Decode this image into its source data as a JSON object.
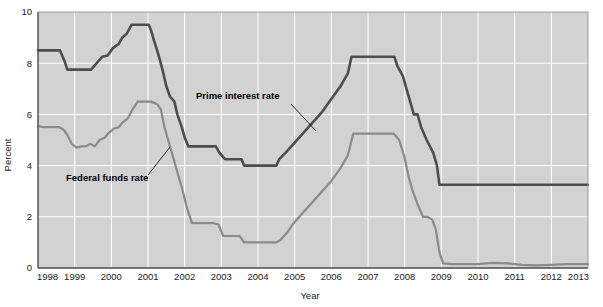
{
  "chart_data": {
    "type": "line",
    "title": "",
    "xlabel": "Year",
    "ylabel": "Percent",
    "xlim": [
      1998,
      2013
    ],
    "ylim": [
      0,
      10
    ],
    "ytick_values": [
      0,
      2,
      4,
      6,
      8,
      10
    ],
    "ytick_labels": [
      "0",
      "2",
      "4",
      "6",
      "8",
      "10"
    ],
    "xtick_values": [
      1998,
      1999,
      2000,
      2001,
      2002,
      2003,
      2004,
      2005,
      2006,
      2007,
      2008,
      2009,
      2010,
      2011,
      2012,
      2013
    ],
    "xtick_labels": [
      "1998",
      "1999",
      "2000",
      "2001",
      "2002",
      "2003",
      "2004",
      "2005",
      "2006",
      "2007",
      "2008",
      "2009",
      "2010",
      "2011",
      "2012",
      "2013"
    ],
    "grid": true,
    "grid_color": "#ffffff",
    "plot_background": "#d2d2d2",
    "legend_position": "inline-annotations",
    "series": [
      {
        "name": "Prime interest rate",
        "color": "#4d4d4d",
        "line_width": 2.6,
        "annotation_label": "Prime interest rate",
        "x": [
          1998.0,
          1998.6,
          1998.72,
          1998.8,
          1999.05,
          1999.45,
          1999.6,
          1999.75,
          1999.9,
          2000.05,
          2000.2,
          2000.3,
          2000.42,
          2000.55,
          2000.7,
          2001.02,
          2001.08,
          2001.17,
          2001.25,
          2001.33,
          2001.42,
          2001.5,
          2001.6,
          2001.72,
          2001.8,
          2001.92,
          2002.0,
          2002.1,
          2002.85,
          2002.95,
          2003.1,
          2003.55,
          2003.62,
          2004.0,
          2004.5,
          2004.58,
          2004.75,
          2005.0,
          2005.25,
          2005.5,
          2005.75,
          2006.0,
          2006.25,
          2006.45,
          2006.55,
          2007.0,
          2007.4,
          2007.72,
          2007.8,
          2007.95,
          2008.05,
          2008.15,
          2008.25,
          2008.35,
          2008.45,
          2008.6,
          2008.78,
          2008.88,
          2008.95,
          2009.0,
          2010.0,
          2011.0,
          2012.0,
          2013.0
        ],
        "y": [
          8.5,
          8.5,
          8.1,
          7.75,
          7.75,
          7.75,
          8.0,
          8.25,
          8.3,
          8.6,
          8.75,
          9.0,
          9.15,
          9.5,
          9.5,
          9.5,
          9.3,
          8.85,
          8.5,
          8.1,
          7.6,
          7.1,
          6.7,
          6.5,
          6.0,
          5.5,
          5.1,
          4.75,
          4.75,
          4.5,
          4.25,
          4.25,
          4.0,
          4.0,
          4.0,
          4.25,
          4.5,
          4.9,
          5.3,
          5.7,
          6.1,
          6.6,
          7.1,
          7.6,
          8.25,
          8.25,
          8.25,
          8.25,
          7.9,
          7.5,
          7.0,
          6.5,
          6.0,
          6.0,
          5.5,
          5.0,
          4.5,
          4.0,
          3.25,
          3.25,
          3.25,
          3.25,
          3.25,
          3.25
        ]
      },
      {
        "name": "Federal funds rate",
        "color": "#8a8a8a",
        "line_width": 2.2,
        "annotation_label": "Federal funds rate",
        "x": [
          1998.0,
          1998.15,
          1998.3,
          1998.45,
          1998.58,
          1998.7,
          1998.8,
          1998.92,
          1999.05,
          1999.18,
          1999.3,
          1999.42,
          1999.55,
          1999.68,
          1999.82,
          1999.95,
          2000.08,
          2000.2,
          2000.32,
          2000.45,
          2000.58,
          2000.72,
          2000.85,
          2001.0,
          2001.08,
          2001.17,
          2001.25,
          2001.35,
          2001.45,
          2001.55,
          2001.65,
          2001.75,
          2001.85,
          2001.95,
          2002.05,
          2002.2,
          2002.5,
          2002.8,
          2002.92,
          2003.05,
          2003.25,
          2003.5,
          2003.62,
          2003.8,
          2004.2,
          2004.5,
          2004.62,
          2004.8,
          2005.0,
          2005.25,
          2005.5,
          2005.75,
          2006.0,
          2006.25,
          2006.45,
          2006.6,
          2007.0,
          2007.4,
          2007.7,
          2007.85,
          2008.0,
          2008.12,
          2008.22,
          2008.35,
          2008.5,
          2008.62,
          2008.75,
          2008.85,
          2008.95,
          2009.05,
          2009.3,
          2009.6,
          2010.0,
          2010.4,
          2010.8,
          2011.2,
          2011.6,
          2012.0,
          2012.4,
          2012.8,
          2013.0
        ],
        "y": [
          5.55,
          5.5,
          5.5,
          5.5,
          5.5,
          5.4,
          5.2,
          4.85,
          4.7,
          4.75,
          4.75,
          4.85,
          4.75,
          5.0,
          5.1,
          5.3,
          5.45,
          5.5,
          5.7,
          5.85,
          6.2,
          6.5,
          6.5,
          6.5,
          6.5,
          6.45,
          6.4,
          6.2,
          5.5,
          5.0,
          4.5,
          4.0,
          3.5,
          3.0,
          2.4,
          1.75,
          1.75,
          1.75,
          1.7,
          1.25,
          1.25,
          1.25,
          1.0,
          1.0,
          1.0,
          1.0,
          1.1,
          1.4,
          1.8,
          2.2,
          2.6,
          3.0,
          3.4,
          3.9,
          4.4,
          5.25,
          5.25,
          5.25,
          5.25,
          5.0,
          4.3,
          3.5,
          3.0,
          2.5,
          2.0,
          2.0,
          1.9,
          1.5,
          0.6,
          0.18,
          0.15,
          0.15,
          0.15,
          0.2,
          0.18,
          0.12,
          0.1,
          0.12,
          0.15,
          0.15,
          0.15
        ]
      }
    ]
  },
  "annotations": {
    "prime": {
      "label": "Prime interest rate",
      "text_x": 196,
      "text_y": 99,
      "leader_from_x": 291,
      "leader_from_y": 104,
      "leader_to_x": 316,
      "leader_to_y": 131
    },
    "fed": {
      "label": "Federal funds rate",
      "text_x": 66,
      "text_y": 181,
      "leader_from_x": 148,
      "leader_from_y": 175,
      "leader_to_x": 170,
      "leader_to_y": 147
    }
  },
  "colors": {
    "plot_background": "#d2d2d2",
    "grid": "#ffffff",
    "axis": "#4a4a4a",
    "prime_series": "#4d4d4d",
    "fed_series": "#8a8a8a",
    "text": "#1a1a1a"
  }
}
